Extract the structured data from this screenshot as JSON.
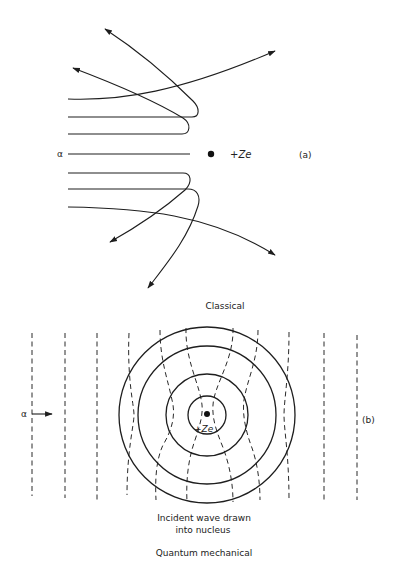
{
  "figure": {
    "panel_a": {
      "label": "(a)",
      "particle_label": "α",
      "nucleus_label": "+Ze",
      "caption": "Classical"
    },
    "panel_b": {
      "label": "(b)",
      "particle_label": "α",
      "nucleus_label": "+Ze",
      "annotation_line1": "Incident wave drawn",
      "annotation_line2": "into nucleus",
      "caption": "Quantum mechanical"
    },
    "colors": {
      "ink": "#1e1e1e",
      "background": "#ffffff"
    }
  }
}
